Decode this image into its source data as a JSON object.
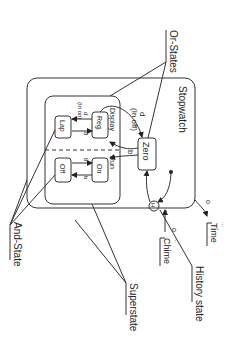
{
  "diagram": {
    "title": "Stopwatch",
    "states": {
      "stopwatch": "Stopwatch",
      "zero": "Zero",
      "display": "Display",
      "reg": "Reg.",
      "lap": "Lap",
      "run": "Run",
      "on": "On",
      "off": "Off",
      "time": "Time",
      "chime": "Chime",
      "history": "H"
    },
    "transitions": {
      "d_in_off": "d",
      "in_off": "(In off)",
      "d_in_on": "(In on)",
      "d_top": "d",
      "d_bottom": "d",
      "b_zero": "b",
      "b_top": "b",
      "b_bottom": "b",
      "o_time": "o",
      "o_chime": "o",
      "star": "*",
      "dots": "..."
    },
    "callouts": {
      "or_states": "Or-States",
      "and_state": "And-State",
      "superstate": "Superstate",
      "history_state": "History state"
    }
  }
}
